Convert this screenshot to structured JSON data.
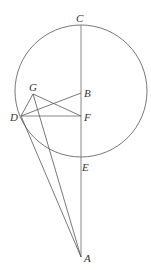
{
  "diagram": {
    "type": "geometry",
    "colors": {
      "stroke": "#555555",
      "axis": "#888888",
      "label": "#333333",
      "background": "#ffffff"
    },
    "circle": {
      "cx": 81,
      "cy": 91,
      "r": 66
    },
    "points": {
      "C": {
        "label": "C",
        "x": 81,
        "y": 25
      },
      "B": {
        "label": "B",
        "x": 81,
        "y": 93
      },
      "F": {
        "label": "F",
        "x": 81,
        "y": 116
      },
      "E": {
        "label": "E",
        "x": 81,
        "y": 157
      },
      "A": {
        "label": "A",
        "x": 81,
        "y": 257
      },
      "D": {
        "label": "D",
        "x": 21,
        "y": 116
      },
      "G": {
        "label": "G",
        "x": 33,
        "y": 94
      }
    },
    "segments": [
      "CA",
      "DF",
      "DB",
      "DG",
      "GF",
      "GA",
      "DA"
    ]
  }
}
